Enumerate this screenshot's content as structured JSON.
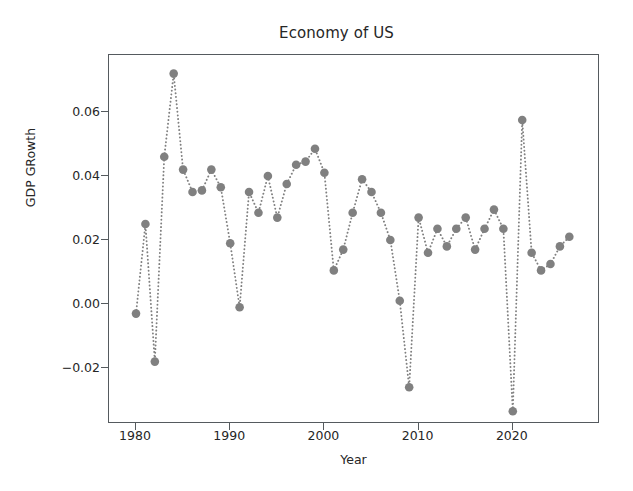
{
  "chart_data": {
    "type": "line",
    "title": "Economy of US",
    "xlabel": "Year",
    "ylabel": "GDP GRowth",
    "grid": false,
    "legend": null,
    "marker": "circle",
    "linestyle": "dotted",
    "color": "#808080",
    "xlim": [
      1977.1,
      1929.2
    ],
    "ylim": [
      -0.0377,
      0.0783
    ],
    "xticks": [
      1980,
      1990,
      2000,
      2010,
      2020
    ],
    "xtick_labels": [
      "1980",
      "1990",
      "2000",
      "2010",
      "2020"
    ],
    "yticks": [
      -0.02,
      0.0,
      0.02,
      0.04,
      0.06
    ],
    "ytick_labels": [
      "−0.02",
      "0.00",
      "0.02",
      "0.04",
      "0.06"
    ],
    "x": [
      1980,
      1981,
      1982,
      1983,
      1984,
      1985,
      1986,
      1987,
      1988,
      1989,
      1990,
      1991,
      1992,
      1993,
      1994,
      1995,
      1996,
      1997,
      1998,
      1999,
      2000,
      2001,
      2002,
      2003,
      2004,
      2005,
      2006,
      2007,
      2008,
      2009,
      2010,
      2011,
      2012,
      2013,
      2014,
      2015,
      2016,
      2017,
      2018,
      2019,
      2020,
      2021,
      2022,
      2023,
      2024,
      2025,
      2026
    ],
    "values": [
      -0.003,
      0.025,
      -0.018,
      0.046,
      0.072,
      0.042,
      0.035,
      0.0355,
      0.042,
      0.0365,
      0.019,
      -0.001,
      0.035,
      0.0285,
      0.04,
      0.027,
      0.0375,
      0.0435,
      0.0445,
      0.0485,
      0.041,
      0.0105,
      0.017,
      0.0285,
      0.039,
      0.035,
      0.0285,
      0.02,
      0.001,
      -0.026,
      0.027,
      0.016,
      0.0235,
      0.018,
      0.0235,
      0.027,
      0.017,
      0.0235,
      0.0295,
      0.0235,
      -0.0335,
      0.0575,
      0.016,
      0.0105,
      0.0125,
      0.018,
      0.021
    ],
    "series": [
      {
        "name": "GDP GRowth",
        "values": [
          -0.003,
          0.025,
          -0.018,
          0.046,
          0.072,
          0.042,
          0.035,
          0.0355,
          0.042,
          0.0365,
          0.019,
          -0.001,
          0.035,
          0.0285,
          0.04,
          0.027,
          0.0375,
          0.0435,
          0.0445,
          0.0485,
          0.041,
          0.0105,
          0.017,
          0.0285,
          0.039,
          0.035,
          0.0285,
          0.02,
          0.001,
          -0.026,
          0.027,
          0.016,
          0.0235,
          0.018,
          0.0235,
          0.027,
          0.017,
          0.0235,
          0.0295,
          0.0235,
          -0.0335,
          0.0575,
          0.016,
          0.0105,
          0.0125,
          0.018,
          0.021
        ]
      }
    ]
  },
  "figure": {
    "background": "#ffffff",
    "axes_color": "#555a5e",
    "text_color": "#262626"
  }
}
